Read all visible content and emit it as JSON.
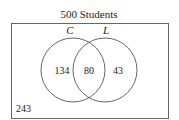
{
  "diagram": {
    "title": "500 Students",
    "sets": [
      {
        "id": "C",
        "label": "C",
        "only_count": "134"
      },
      {
        "id": "L",
        "label": "L",
        "only_count": "43"
      }
    ],
    "intersection_count": "80",
    "outside_count": "243",
    "colors": {
      "stroke": "#555555",
      "text": "#222222",
      "background": "#ffffff"
    }
  }
}
